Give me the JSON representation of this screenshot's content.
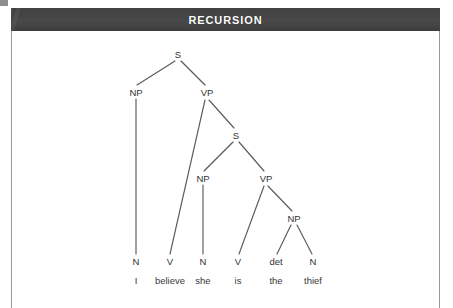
{
  "header": {
    "title": "RECURSION",
    "background_color": "#464646",
    "text_color": "#ffffff"
  },
  "figure": {
    "border_color": "#9a9a9a",
    "background_color": "#ffffff",
    "line_color": "#5a5a5a",
    "label_color": "#333333"
  },
  "tree": {
    "sentence": "I believe she is the thief",
    "nodes": {
      "root_s": {
        "label": "S",
        "x": 178,
        "y": 55
      },
      "np1": {
        "label": "NP",
        "x": 136,
        "y": 93
      },
      "vp1": {
        "label": "VP",
        "x": 207,
        "y": 93
      },
      "s2": {
        "label": "S",
        "x": 236,
        "y": 136
      },
      "np2": {
        "label": "NP",
        "x": 203,
        "y": 179
      },
      "vp2": {
        "label": "VP",
        "x": 266,
        "y": 179
      },
      "np3": {
        "label": "NP",
        "x": 294,
        "y": 219
      }
    },
    "terminals": [
      {
        "pos": "N",
        "word": "I",
        "x": 136
      },
      {
        "pos": "V",
        "word": "believe",
        "x": 170
      },
      {
        "pos": "N",
        "word": "she",
        "x": 203
      },
      {
        "pos": "V",
        "word": "is",
        "x": 238
      },
      {
        "pos": "det",
        "word": "the",
        "x": 276
      },
      {
        "pos": "N",
        "word": "thief",
        "x": 313
      }
    ],
    "pos_row_y": 262,
    "word_row_y": 281
  }
}
